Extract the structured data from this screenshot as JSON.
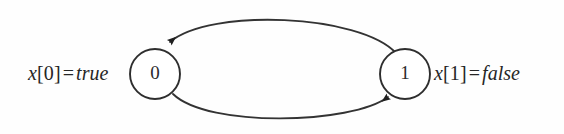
{
  "figure": {
    "type": "state-transition-diagram",
    "background_color": "#ffffff",
    "stroke_color": "#333333"
  },
  "nodes": [
    {
      "id": "state-0",
      "label": "0",
      "cx": 155,
      "cy": 74,
      "r": 25
    },
    {
      "id": "state-1",
      "label": "1",
      "cx": 405,
      "cy": 74,
      "r": 25
    }
  ],
  "edges": [
    {
      "id": "edge-1-to-0",
      "from": "1",
      "to": "0",
      "direction": "right-to-left",
      "position": "top",
      "arrowhead": "filled-triangle"
    },
    {
      "id": "edge-0-to-1",
      "from": "0",
      "to": "1",
      "direction": "left-to-right",
      "position": "bottom",
      "arrowhead": "filled-triangle"
    }
  ],
  "labels": {
    "left": {
      "var_name": "x",
      "var_index": "[0]",
      "equals": "=",
      "value": "true",
      "full_text": "x[0] = true"
    },
    "right": {
      "var_name": "x",
      "var_index": "[1]",
      "equals": "=",
      "value": "false",
      "full_text": "x[1] = false"
    }
  }
}
